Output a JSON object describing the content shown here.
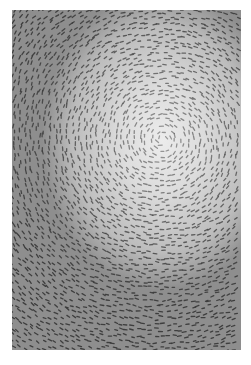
{
  "artwork": {
    "description": "Grayscale abstract artwork of small dash marks arranged in concentric swirling patterns",
    "colors": {
      "background": "#ffffff",
      "light": "#ececec",
      "mid": "#bcbcbc",
      "dark": "#8e8e8e",
      "mark": "#3a3a3a"
    },
    "swirl_center": {
      "x": 150,
      "y": 130
    }
  }
}
